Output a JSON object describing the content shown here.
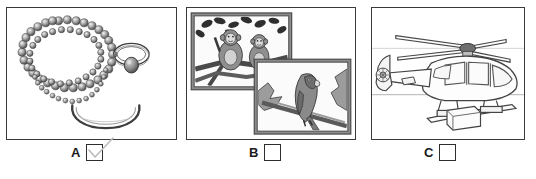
{
  "document": {
    "type": "multiple-choice-picture-question",
    "panel_count": 3,
    "background_color": "#ffffff",
    "border_color": "#3a3a3a"
  },
  "panels": [
    {
      "id": "A",
      "letter": "A",
      "subject": "jewelry",
      "checkbox_label": "A",
      "checked": true,
      "check_mark": "check-stroke",
      "items": [
        {
          "name": "pearl-necklace",
          "description": "long coiled strand of round pearls"
        },
        {
          "name": "gemstone-ring",
          "description": "ring with oval gray gemstone"
        },
        {
          "name": "bangle-bracelet",
          "description": "open cuff bangle"
        }
      ]
    },
    {
      "id": "B",
      "letter": "B",
      "subject": "framed animal photographs",
      "checkbox_label": "B",
      "checked": false,
      "check_mark": "",
      "items": [
        {
          "name": "monkeys-photo",
          "description": "two monkeys sitting on a tree branch"
        },
        {
          "name": "parrot-photo",
          "description": "parrot perched on a branch"
        }
      ]
    },
    {
      "id": "C",
      "letter": "C",
      "subject": "helicopter",
      "checkbox_label": "C",
      "checked": false,
      "check_mark": "",
      "items": [
        {
          "name": "helicopter",
          "description": "line drawing of a helicopter with main rotor, tail boom and skids"
        }
      ]
    }
  ],
  "colors": {
    "ink": "#2e2e2e",
    "line_light": "#9a9a9a",
    "frame_gray": "#8c8c8c",
    "photo_fill": "#b5b5b5",
    "check_stroke": "#b9b9b9"
  }
}
